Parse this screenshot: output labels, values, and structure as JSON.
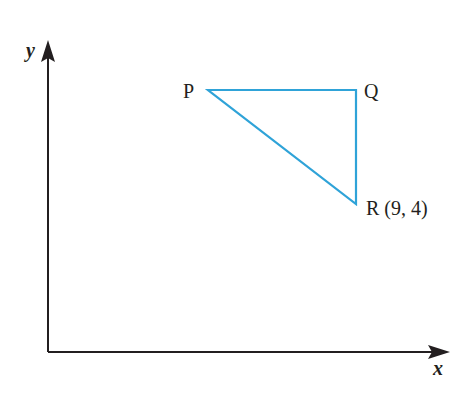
{
  "diagram": {
    "axes": {
      "x_label": "x",
      "y_label": "y"
    },
    "points": {
      "P": {
        "label": "P"
      },
      "Q": {
        "label": "Q"
      },
      "R": {
        "label": "R (9, 4)",
        "coords": [
          9,
          4
        ]
      }
    },
    "colors": {
      "triangle": "#2fa3d8",
      "axes": "#231f20"
    }
  }
}
